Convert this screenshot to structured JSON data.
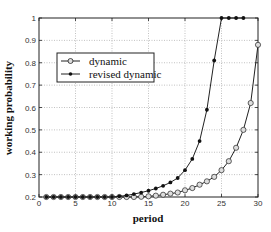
{
  "chart_data": {
    "type": "line",
    "title": "",
    "xlabel": "period",
    "ylabel": "working probability",
    "xlim": [
      0,
      30
    ],
    "ylim": [
      0.2,
      1
    ],
    "xticks": [
      0,
      5,
      10,
      15,
      20,
      25,
      30
    ],
    "yticks": [
      0.2,
      0.3,
      0.4,
      0.5,
      0.6,
      0.7,
      0.8,
      0.9,
      1
    ],
    "grid": true,
    "legend_position": "upper-left",
    "series": [
      {
        "name": "dynamic",
        "marker": "circle",
        "x": [
          1,
          2,
          3,
          4,
          5,
          6,
          7,
          8,
          9,
          10,
          11,
          12,
          13,
          14,
          15,
          16,
          17,
          18,
          19,
          20,
          21,
          22,
          23,
          24,
          25,
          26,
          27,
          28,
          29,
          30
        ],
        "values": [
          0.2,
          0.2,
          0.2,
          0.2,
          0.2,
          0.2,
          0.2,
          0.2,
          0.2,
          0.2,
          0.2,
          0.2,
          0.2,
          0.201,
          0.203,
          0.206,
          0.21,
          0.215,
          0.22,
          0.23,
          0.24,
          0.255,
          0.27,
          0.29,
          0.32,
          0.36,
          0.42,
          0.5,
          0.62,
          0.88
        ]
      },
      {
        "name": "revised dynamic",
        "marker": "dot",
        "x": [
          1,
          2,
          3,
          4,
          5,
          6,
          7,
          8,
          9,
          10,
          11,
          12,
          13,
          14,
          15,
          16,
          17,
          18,
          19,
          20,
          21,
          22,
          23,
          24,
          25,
          26,
          27,
          28
        ],
        "values": [
          0.2,
          0.2,
          0.2,
          0.2,
          0.2,
          0.2,
          0.2,
          0.2,
          0.2,
          0.2,
          0.203,
          0.207,
          0.213,
          0.22,
          0.228,
          0.238,
          0.25,
          0.265,
          0.285,
          0.32,
          0.37,
          0.45,
          0.59,
          0.81,
          1,
          1,
          1,
          1
        ]
      }
    ]
  },
  "legend": {
    "items": [
      "dynamic",
      "revised dynamic"
    ]
  }
}
